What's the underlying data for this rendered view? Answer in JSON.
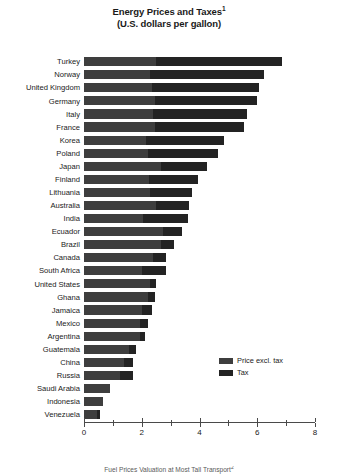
{
  "chart_data": {
    "type": "bar",
    "orientation": "horizontal",
    "stacked": true,
    "title": "Energy Prices and Taxes",
    "title_footnote_marker": "1",
    "subtitle": "(U.S. dollars per gallon)",
    "xlabel": "",
    "ylabel": "",
    "xlim": [
      0,
      8
    ],
    "xticks": [
      0,
      1,
      2,
      3,
      4,
      5,
      6,
      7,
      8
    ],
    "xtick_labels": [
      "0",
      "",
      "2",
      "",
      "4",
      "",
      "6",
      "",
      "8"
    ],
    "grid": false,
    "legend_position": "right-inside",
    "categories": [
      "Turkey",
      "Norway",
      "United Kingdom",
      "Germany",
      "Italy",
      "France",
      "Korea",
      "Poland",
      "Japan",
      "Finland",
      "Lithuania",
      "Australia",
      "India",
      "Ecuador",
      "Brazil",
      "Canada",
      "South Africa",
      "United States",
      "Ghana",
      "Jamaica",
      "Mexico",
      "Argentina",
      "Guatemala",
      "China",
      "Russia",
      "Saudi Arabia",
      "Indonesia",
      "Venezuela"
    ],
    "series": [
      {
        "name": "Price excl. tax",
        "color": "#3e3e3e",
        "values": [
          2.5,
          2.3,
          2.35,
          2.45,
          2.4,
          2.45,
          2.15,
          2.2,
          2.65,
          2.25,
          2.3,
          2.5,
          2.05,
          2.75,
          2.65,
          2.4,
          2.0,
          2.3,
          2.2,
          2.0,
          1.95,
          1.95,
          1.55,
          1.4,
          1.25,
          0.9,
          0.65,
          0.45
        ]
      },
      {
        "name": "Tax",
        "color": "#232323",
        "values": [
          4.35,
          3.95,
          3.7,
          3.55,
          3.25,
          3.1,
          2.7,
          2.45,
          1.6,
          1.7,
          1.45,
          1.15,
          1.55,
          0.65,
          0.45,
          0.45,
          0.85,
          0.2,
          0.25,
          0.35,
          0.25,
          0.15,
          0.25,
          0.3,
          0.45,
          0.0,
          0.0,
          0.1
        ]
      }
    ],
    "totals": [
      6.85,
      6.25,
      6.05,
      6.0,
      5.65,
      5.55,
      4.85,
      4.65,
      4.25,
      3.95,
      3.75,
      3.65,
      3.6,
      3.4,
      3.1,
      2.85,
      2.85,
      2.5,
      2.45,
      2.35,
      2.2,
      2.1,
      1.8,
      1.7,
      1.7,
      0.9,
      0.65,
      0.55
    ]
  },
  "legend": {
    "items": [
      {
        "label": "Price excl. tax",
        "swatch": "price"
      },
      {
        "label": "Tax",
        "swatch": "tax"
      }
    ]
  },
  "footnote": {
    "text": "Fuel Prices Valuation at Most Tall Transport",
    "marker": "2"
  },
  "colors": {
    "price_excl_tax": "#3e3e3e",
    "tax": "#232323",
    "axis": "#4a4a4a",
    "text": "#1a1a1a",
    "background": "#ffffff"
  }
}
